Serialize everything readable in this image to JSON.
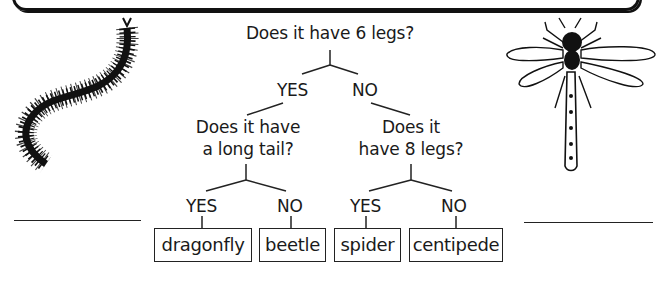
{
  "diagram": {
    "type": "classification-key",
    "root": {
      "question": "Does it have 6 legs?",
      "yes": {
        "label": "YES",
        "question_line1": "Does it have",
        "question_line2": "a long tail?",
        "yes": {
          "label": "YES",
          "result": "dragonfly"
        },
        "no": {
          "label": "NO",
          "result": "beetle"
        }
      },
      "no": {
        "label": "NO",
        "question_line1": "Does it",
        "question_line2": "have 8 legs?",
        "yes": {
          "label": "YES",
          "result": "spider"
        },
        "no": {
          "label": "NO",
          "result": "centipede"
        }
      }
    },
    "illustrations": [
      {
        "name": "centipede",
        "position": "left"
      },
      {
        "name": "dragonfly",
        "position": "right"
      }
    ],
    "answer_blanks": [
      "",
      ""
    ]
  }
}
